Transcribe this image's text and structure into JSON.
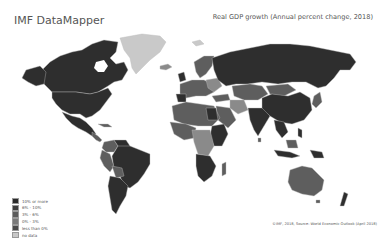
{
  "header": {
    "app_title": "IMF DataMapper",
    "map_title": "Real GDP growth (Annual percent change, 2018)"
  },
  "legend": {
    "items": [
      {
        "label": "10% or more",
        "color": "#2a2a2a"
      },
      {
        "label": "6% - 10%",
        "color": "#3d3d3d"
      },
      {
        "label": "3% - 6%",
        "color": "#5c5c5c"
      },
      {
        "label": "0% - 3%",
        "color": "#7a7a7a"
      },
      {
        "label": "less than 0%",
        "color": "#4a4a4a"
      },
      {
        "label": "no data",
        "color": "#c8c8c8"
      }
    ]
  },
  "footer": {
    "source": "©IMF, 2018, Source: World Economic Outlook (April 2018)"
  },
  "colors": {
    "dark": "#2e2e2e",
    "mid": "#5e5e5e",
    "light": "#8a8a8a",
    "nodata": "#c9c9c9",
    "border": "#bdbdbd"
  }
}
